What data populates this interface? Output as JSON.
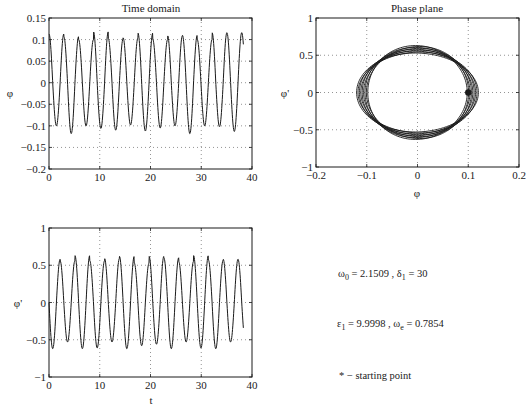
{
  "chart_data": [
    {
      "id": "time-domain-phi",
      "type": "line",
      "title": "Time domain",
      "xlabel": "",
      "ylabel": "φ",
      "xlim": [
        0,
        40
      ],
      "ylim": [
        -0.2,
        0.15
      ],
      "xticks": [
        0,
        10,
        20,
        30,
        40
      ],
      "xtick_labels": [
        "0",
        "10",
        "20",
        "30",
        "40"
      ],
      "yticks": [
        -0.2,
        -0.15,
        -0.1,
        -0.05,
        0,
        0.05,
        0.1,
        0.15
      ],
      "ytick_labels": [
        "−0.2",
        "−0.15",
        "−0.1",
        "−0.05",
        "0",
        "0.05",
        "0.1",
        "0.15"
      ],
      "grid": true,
      "t_end": 38.3,
      "amplitude_range": [
        0.1,
        0.12
      ],
      "frequency_rad": 2.1509,
      "start": [
        0,
        0.1
      ],
      "peaks": [
        0.113,
        0.107,
        0.1,
        0.118,
        0.102,
        0.104,
        0.115,
        0.1,
        0.109,
        0.11,
        0.1,
        0.116
      ],
      "troughs": [
        -0.1,
        -0.118,
        -0.1,
        -0.106,
        -0.11,
        -0.098,
        -0.112,
        -0.105,
        -0.1,
        -0.118,
        -0.1,
        -0.102,
        -0.113
      ]
    },
    {
      "id": "phase-plane",
      "type": "line",
      "title": "Phase plane",
      "xlabel": "φ",
      "ylabel": "φ'",
      "xlim": [
        -0.2,
        0.2
      ],
      "ylim": [
        -1,
        1
      ],
      "xticks": [
        -0.2,
        -0.1,
        0,
        0.1,
        0.2
      ],
      "xtick_labels": [
        "−0.2",
        "−0.1",
        "0",
        "0.1",
        "0.2"
      ],
      "yticks": [
        -1,
        -0.5,
        0,
        0.5,
        1
      ],
      "ytick_labels": [
        "−1",
        "−0.5",
        "0",
        "0.5",
        "1"
      ],
      "grid": true,
      "orbit_phi_range": [
        0.098,
        0.12
      ],
      "orbit_dphi_range": [
        0.53,
        0.63
      ],
      "start_point": {
        "phi": 0.1,
        "dphi": 0,
        "marker": "*"
      }
    },
    {
      "id": "time-domain-dphi",
      "type": "line",
      "title": "",
      "xlabel": "t",
      "ylabel": "φ'",
      "xlim": [
        0,
        40
      ],
      "ylim": [
        -1,
        1
      ],
      "xticks": [
        0,
        10,
        20,
        30,
        40
      ],
      "xtick_labels": [
        "0",
        "10",
        "20",
        "30",
        "40"
      ],
      "yticks": [
        -1,
        -0.5,
        0,
        0.5,
        1
      ],
      "ytick_labels": [
        "−1",
        "−0.5",
        "0",
        "0.5",
        "1"
      ],
      "grid": true,
      "t_end": 38.3,
      "start": [
        0,
        0
      ],
      "peaks": [
        0.58,
        0.56,
        0.63,
        0.56,
        0.59,
        0.62,
        0.53,
        0.62,
        0.6,
        0.55,
        0.63,
        0.57,
        0.58
      ],
      "troughs": [
        -0.62,
        -0.53,
        -0.62,
        -0.61,
        -0.53,
        -0.62,
        -0.58,
        -0.56,
        -0.62,
        -0.53,
        -0.61,
        -0.62,
        -0.53
      ]
    }
  ],
  "annotations": {
    "omega0_label": "ω",
    "omega0_sub": "0",
    "omega0_value": " = 2.1509 ,  ",
    "delta1_label": "δ",
    "delta1_sub": "1",
    "delta1_value": " = 30",
    "eps1_label": "ε",
    "eps1_sub": "1",
    "eps1_value": " = 9.9998 ,  ",
    "omegae_label": "ω",
    "omegae_sub": "e",
    "omegae_value": " = 0.7854",
    "legend_note": "* − starting point"
  },
  "colors": {
    "line": "#1a1a1a",
    "grid": "#555555",
    "axes": "#1a1a1a",
    "background": "#ffffff"
  }
}
